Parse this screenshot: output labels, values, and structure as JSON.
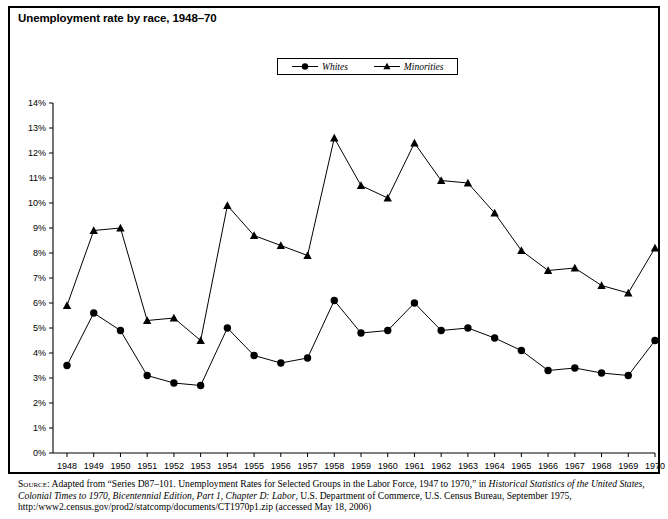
{
  "title": "Unemployment rate by race, 1948–70",
  "legend": {
    "position": "top-center",
    "entries": [
      {
        "label": "Whites",
        "marker": "circle-marker-icon",
        "color": "#000000"
      },
      {
        "label": "Minorities",
        "marker": "triangle-marker-icon",
        "color": "#000000"
      }
    ]
  },
  "source": {
    "kicker": "Source:",
    "line1_a": " Adapted from “Series D87–101. Unemployment Rates for Selected Groups in the Labor Force, 1947 to 1970,” in ",
    "line1_italic": "Historical Statistics of the United States, Colonial Times to 1970, Bicentennial Edition, Part 1, Chapter D: Labor",
    "line2_a": ", U.S. Department of Commerce, U.S. Census Bureau, September 1975, http:/www2.census.gov/prod2/statcomp/documents/CT1970p1.zip (accessed May 18, 2006)"
  },
  "chart_data": {
    "type": "line",
    "title": "Unemployment rate by race, 1948–70",
    "xlabel": "",
    "ylabel": "",
    "grid": false,
    "legend_position": "top-center",
    "ylim": [
      0,
      14
    ],
    "ytick_step": 1,
    "ytick_labels": [
      "0%",
      "1%",
      "2%",
      "3%",
      "4%",
      "5%",
      "6%",
      "7%",
      "8%",
      "9%",
      "10%",
      "11%",
      "12%",
      "13%",
      "14%"
    ],
    "categories": [
      "1948",
      "1949",
      "1950",
      "1951",
      "1952",
      "1953",
      "1954",
      "1955",
      "1956",
      "1957",
      "1958",
      "1959",
      "1960",
      "1961",
      "1962",
      "1963",
      "1964",
      "1965",
      "1966",
      "1967",
      "1968",
      "1969",
      "1970"
    ],
    "series": [
      {
        "name": "Whites",
        "marker": "circle",
        "color": "#000000",
        "values": [
          3.5,
          5.6,
          4.9,
          3.1,
          2.8,
          2.7,
          5.0,
          3.9,
          3.6,
          3.8,
          6.1,
          4.8,
          4.9,
          6.0,
          4.9,
          5.0,
          4.6,
          4.1,
          3.3,
          3.4,
          3.2,
          3.1,
          4.5
        ]
      },
      {
        "name": "Minorities",
        "marker": "triangle",
        "color": "#000000",
        "values": [
          5.9,
          8.9,
          9.0,
          5.3,
          5.4,
          4.5,
          9.9,
          8.7,
          8.3,
          7.9,
          12.6,
          10.7,
          10.2,
          12.4,
          10.9,
          10.8,
          9.6,
          8.1,
          7.3,
          7.4,
          6.7,
          6.4,
          8.2
        ]
      }
    ]
  }
}
